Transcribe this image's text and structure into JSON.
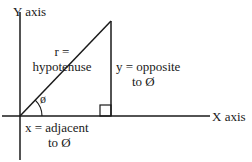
{
  "diagram": {
    "type": "right-triangle-trigonometry",
    "labels": {
      "y_axis": "Y axis",
      "x_axis": "X axis",
      "hypotenuse_line1": "r =",
      "hypotenuse_line2": "hypotenuse",
      "opposite_line1": "y = opposite",
      "opposite_line2": "to Ø",
      "adjacent_line1": "x = adjacent",
      "adjacent_line2": "to Ø",
      "angle": "ø"
    },
    "colors": {
      "line": "#1a1a1a",
      "background": "#ffffff"
    }
  }
}
